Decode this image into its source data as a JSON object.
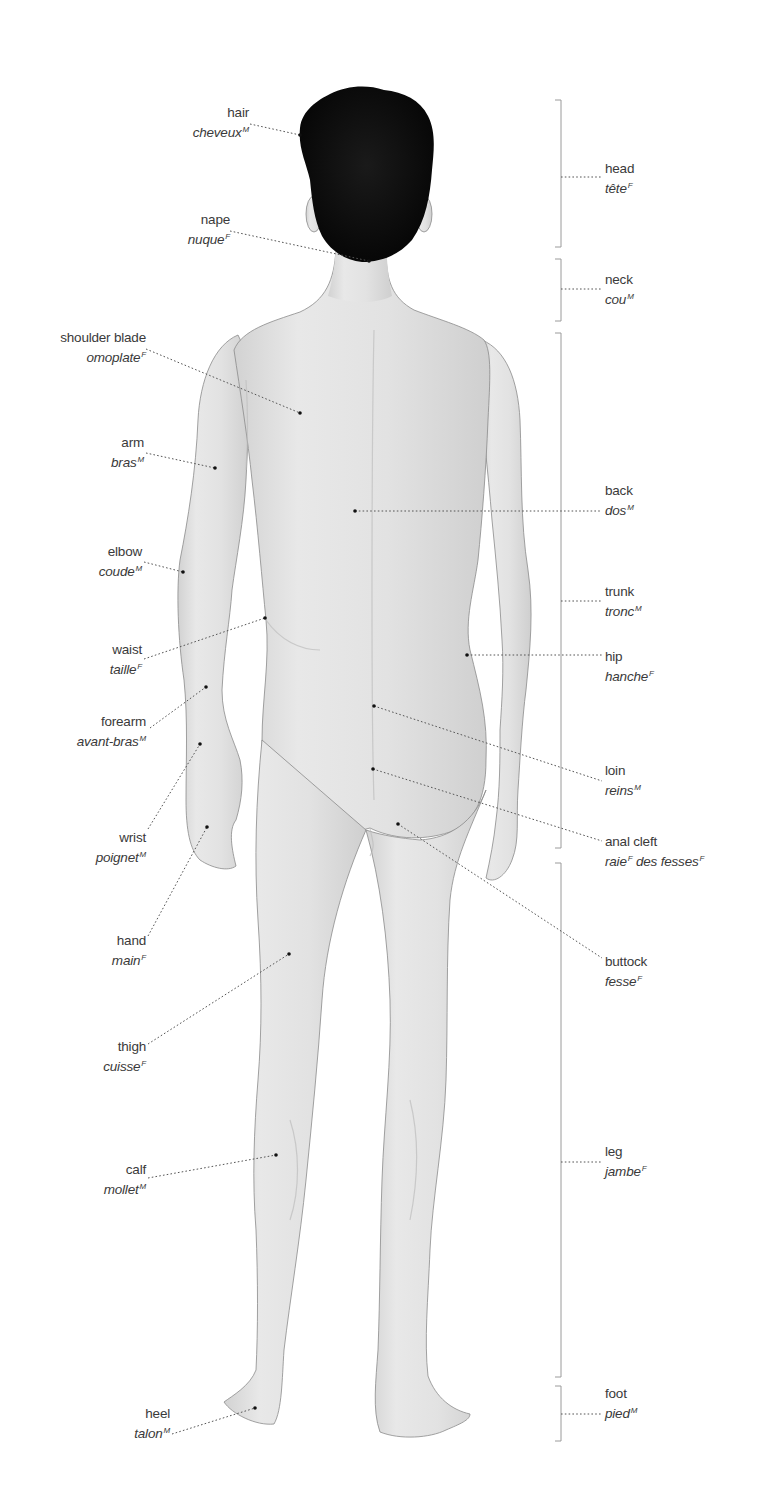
{
  "diagram": {
    "title": "",
    "colors": {
      "background": "#ffffff",
      "skin": "#e4e4e4",
      "skin_shadow": "#c9c9c9",
      "hair": "#0d0d0d",
      "outline": "#8a8a8a",
      "leader": "#555555",
      "bracket": "#9a9a9a",
      "text": "#3a3a3a"
    },
    "left_labels": [
      {
        "id": "hair",
        "en": "hair",
        "fr": "cheveux",
        "gender": "M"
      },
      {
        "id": "nape",
        "en": "nape",
        "fr": "nuque",
        "gender": "F"
      },
      {
        "id": "shoulder-blade",
        "en": "shoulder blade",
        "fr": "omoplate",
        "gender": "F"
      },
      {
        "id": "arm",
        "en": "arm",
        "fr": "bras",
        "gender": "M"
      },
      {
        "id": "elbow",
        "en": "elbow",
        "fr": "coude",
        "gender": "M"
      },
      {
        "id": "waist",
        "en": "waist",
        "fr": "taille",
        "gender": "F"
      },
      {
        "id": "forearm",
        "en": "forearm",
        "fr": "avant-bras",
        "gender": "M"
      },
      {
        "id": "wrist",
        "en": "wrist",
        "fr": "poignet",
        "gender": "M"
      },
      {
        "id": "hand",
        "en": "hand",
        "fr": "main",
        "gender": "F"
      },
      {
        "id": "thigh",
        "en": "thigh",
        "fr": "cuisse",
        "gender": "F"
      },
      {
        "id": "calf",
        "en": "calf",
        "fr": "mollet",
        "gender": "M"
      },
      {
        "id": "heel",
        "en": "heel",
        "fr": "talon",
        "gender": "M"
      }
    ],
    "right_labels": [
      {
        "id": "head",
        "en": "head",
        "fr": "tête",
        "gender": "F"
      },
      {
        "id": "neck",
        "en": "neck",
        "fr": "cou",
        "gender": "M"
      },
      {
        "id": "back",
        "en": "back",
        "fr": "dos",
        "gender": "M"
      },
      {
        "id": "trunk",
        "en": "trunk",
        "fr": "tronc",
        "gender": "M"
      },
      {
        "id": "hip",
        "en": "hip",
        "fr": "hanche",
        "gender": "F"
      },
      {
        "id": "loin",
        "en": "loin",
        "fr": "reins",
        "gender": "M"
      },
      {
        "id": "anal-cleft",
        "en": "anal cleft",
        "fr": "raie",
        "gender": "F",
        "fr2": " des fesses",
        "gender2": "F"
      },
      {
        "id": "buttock",
        "en": "buttock",
        "fr": "fesse",
        "gender": "F"
      },
      {
        "id": "leg",
        "en": "leg",
        "fr": "jambe",
        "gender": "F"
      },
      {
        "id": "foot",
        "en": "foot",
        "fr": "pied",
        "gender": "M"
      }
    ],
    "brackets": [
      {
        "id": "head",
        "top": 100,
        "bottom": 247
      },
      {
        "id": "neck",
        "top": 259,
        "bottom": 321
      },
      {
        "id": "trunk",
        "top": 333,
        "bottom": 848
      },
      {
        "id": "leg",
        "top": 863,
        "bottom": 1377
      },
      {
        "id": "foot",
        "top": 1386,
        "bottom": 1441
      }
    ]
  }
}
